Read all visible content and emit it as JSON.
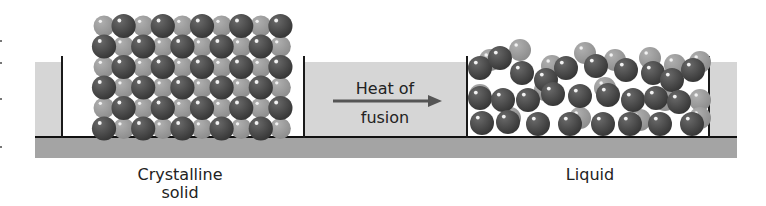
{
  "colors": {
    "panel": "#d6d6d6",
    "floor": "#a4a4a4",
    "dark_sphere": "#474747",
    "light_sphere": "#9c9c9c",
    "line": "#1a1a1a"
  },
  "labels": {
    "solid_line1": "Crystalline",
    "solid_line2": "solid",
    "arrow_line1": "Heat of",
    "arrow_line2": "fusion",
    "liquid": "Liquid"
  },
  "icons": {
    "arrow": "right-arrow-icon"
  }
}
